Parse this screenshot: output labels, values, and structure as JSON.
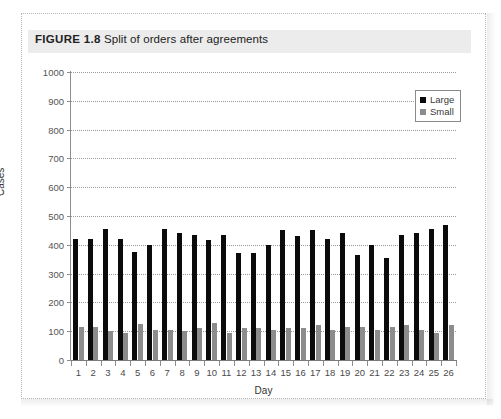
{
  "figure": {
    "label": "FIGURE 1.8",
    "caption": "Split of orders after agreements"
  },
  "chart_data": {
    "type": "bar",
    "title": "Split of orders after agreements",
    "xlabel": "Day",
    "ylabel": "Cases",
    "ylim": [
      0,
      1000
    ],
    "ytick_step": 100,
    "yticks": [
      "1000",
      "900",
      "800",
      "700",
      "600",
      "500",
      "400",
      "300",
      "200",
      "100",
      "0"
    ],
    "grid": true,
    "legend_position": "top-right",
    "categories": [
      "1",
      "2",
      "3",
      "4",
      "5",
      "6",
      "7",
      "8",
      "9",
      "10",
      "11",
      "12",
      "13",
      "14",
      "15",
      "16",
      "17",
      "18",
      "19",
      "20",
      "21",
      "22",
      "23",
      "24",
      "25",
      "26"
    ],
    "series": [
      {
        "name": "Large",
        "color": "#0b0b0b",
        "values": [
          420,
          420,
          455,
          420,
          375,
          400,
          455,
          440,
          435,
          415,
          435,
          370,
          370,
          400,
          450,
          430,
          450,
          420,
          440,
          365,
          400,
          355,
          435,
          440,
          455,
          470
        ]
      },
      {
        "name": "Small",
        "color": "#8c8c8c",
        "values": [
          115,
          115,
          100,
          95,
          125,
          105,
          105,
          100,
          110,
          130,
          95,
          110,
          110,
          105,
          110,
          110,
          120,
          105,
          115,
          115,
          105,
          115,
          120,
          105,
          95,
          120
        ]
      }
    ]
  },
  "legend": {
    "items": [
      {
        "label": "Large",
        "color": "#0b0b0b"
      },
      {
        "label": "Small",
        "color": "#8c8c8c"
      }
    ]
  }
}
